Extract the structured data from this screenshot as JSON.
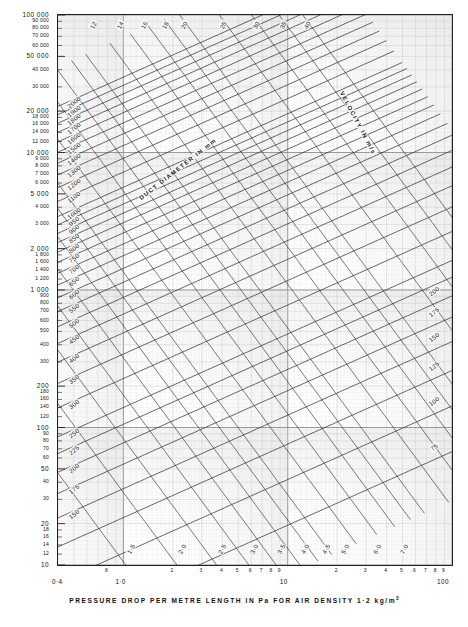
{
  "axes": {
    "ylabel": "AIR  QUANTITY  IN  LITRES  PER  SECOND",
    "xlabel_pre": "PRESSURE   DROP   PER   METRE   LENGTH   IN       Pa     FOR   AIR   DENSITY   1·2 kg/m",
    "xlabel_sup": "3"
  },
  "annotations": {
    "duct_diameter": "DUCT    DIAMETER    IN    mm",
    "velocity": "VELOCITY    IN    m/s"
  },
  "chart_data": {
    "type": "line",
    "title": "",
    "xlabel": "PRESSURE DROP PER METRE LENGTH IN Pa FOR AIR DENSITY 1·2 kg/m3",
    "ylabel": "AIR QUANTITY IN LITRES PER SECOND",
    "xscale": "log",
    "yscale": "log",
    "xlim": [
      0.4,
      100
    ],
    "ylim": [
      10,
      100000
    ],
    "grid": true,
    "legend": "none",
    "x_major_ticks": [
      "0·4",
      "1·0",
      "10",
      "100"
    ],
    "x_minor_tick_labels": [
      {
        "value": 2,
        "label": "2"
      },
      {
        "value": 3,
        "label": "3"
      },
      {
        "value": 4,
        "label": "4"
      },
      {
        "value": 5,
        "label": "5"
      },
      {
        "value": 6,
        "label": "6"
      },
      {
        "value": 7,
        "label": "7"
      },
      {
        "value": 8,
        "label": "8"
      },
      {
        "value": 9,
        "label": "9"
      },
      {
        "value": 20,
        "label": "2"
      },
      {
        "value": 30,
        "label": "3"
      },
      {
        "value": 40,
        "label": "4"
      },
      {
        "value": 50,
        "label": "5"
      },
      {
        "value": 60,
        "label": "6"
      },
      {
        "value": 70,
        "label": "7"
      },
      {
        "value": 80,
        "label": "8"
      },
      {
        "value": 90,
        "label": "9"
      },
      {
        "value": 0.8,
        "label": "8"
      }
    ],
    "y_ticks": [
      {
        "value": 100000,
        "label": "100 000",
        "major": true
      },
      {
        "value": 90000,
        "label": "90 000",
        "major": false
      },
      {
        "value": 80000,
        "label": "80 000",
        "major": false
      },
      {
        "value": 70000,
        "label": "70 000",
        "major": false
      },
      {
        "value": 60000,
        "label": "60 000",
        "major": false
      },
      {
        "value": 50000,
        "label": "50 000",
        "major": true
      },
      {
        "value": 40000,
        "label": "40 000",
        "major": false
      },
      {
        "value": 30000,
        "label": "30 000",
        "major": false
      },
      {
        "value": 20000,
        "label": "20 000",
        "major": true
      },
      {
        "value": 18000,
        "label": "18 000",
        "major": false
      },
      {
        "value": 16000,
        "label": "16 000",
        "major": false
      },
      {
        "value": 14000,
        "label": "14 000",
        "major": false
      },
      {
        "value": 12000,
        "label": "12 000",
        "major": false
      },
      {
        "value": 10000,
        "label": "10 000",
        "major": true
      },
      {
        "value": 9000,
        "label": "9 000",
        "major": false
      },
      {
        "value": 8000,
        "label": "8 000",
        "major": false
      },
      {
        "value": 7000,
        "label": "7 000",
        "major": false
      },
      {
        "value": 6000,
        "label": "6 000",
        "major": false
      },
      {
        "value": 5000,
        "label": "5 000",
        "major": true
      },
      {
        "value": 4000,
        "label": "4 000",
        "major": false
      },
      {
        "value": 3000,
        "label": "3 000",
        "major": false
      },
      {
        "value": 2000,
        "label": "2 000",
        "major": true
      },
      {
        "value": 1800,
        "label": "1 800",
        "major": false
      },
      {
        "value": 1600,
        "label": "1 600",
        "major": false
      },
      {
        "value": 1400,
        "label": "1 400",
        "major": false
      },
      {
        "value": 1200,
        "label": "1 200",
        "major": false
      },
      {
        "value": 1000,
        "label": "1 000",
        "major": true
      },
      {
        "value": 900,
        "label": "900",
        "major": false
      },
      {
        "value": 800,
        "label": "800",
        "major": false
      },
      {
        "value": 700,
        "label": "700",
        "major": false
      },
      {
        "value": 600,
        "label": "600",
        "major": false
      },
      {
        "value": 500,
        "label": "500",
        "major": false
      },
      {
        "value": 400,
        "label": "400",
        "major": false
      },
      {
        "value": 300,
        "label": "300",
        "major": false
      },
      {
        "value": 200,
        "label": "200",
        "major": true
      },
      {
        "value": 180,
        "label": "180",
        "major": false
      },
      {
        "value": 160,
        "label": "160",
        "major": false
      },
      {
        "value": 140,
        "label": "140",
        "major": false
      },
      {
        "value": 120,
        "label": "120",
        "major": false
      },
      {
        "value": 100,
        "label": "100",
        "major": true
      },
      {
        "value": 90,
        "label": "90",
        "major": false
      },
      {
        "value": 80,
        "label": "80",
        "major": false
      },
      {
        "value": 70,
        "label": "70",
        "major": false
      },
      {
        "value": 60,
        "label": "60",
        "major": false
      },
      {
        "value": 50,
        "label": "50",
        "major": true
      },
      {
        "value": 40,
        "label": "40",
        "major": false
      },
      {
        "value": 30,
        "label": "30",
        "major": false
      },
      {
        "value": 20,
        "label": "20",
        "major": true
      },
      {
        "value": 18,
        "label": "18",
        "major": false
      },
      {
        "value": 16,
        "label": "16",
        "major": false
      },
      {
        "value": 14,
        "label": "14",
        "major": false
      },
      {
        "value": 12,
        "label": "12",
        "major": false
      },
      {
        "value": 10,
        "label": "10",
        "major": true
      }
    ],
    "duct_diameter_lines_mm": [
      2000,
      1900,
      1800,
      1700,
      1600,
      1500,
      1400,
      1300,
      1200,
      1100,
      1000,
      950,
      900,
      850,
      800,
      750,
      700,
      650,
      600,
      550,
      500,
      450,
      400,
      350,
      300,
      250,
      225,
      200,
      175,
      150,
      125,
      100,
      75
    ],
    "duct_labels_left": [
      "2000",
      "1900",
      "1800",
      "1700",
      "1600",
      "1500",
      "1400",
      "1300",
      "1200",
      "1100",
      "1000",
      "950",
      "900",
      "850",
      "800",
      "750",
      "700",
      "650",
      "600",
      "550",
      "500",
      "450",
      "400",
      "350",
      "300",
      "250",
      "225",
      "200",
      "175",
      "150"
    ],
    "duct_labels_right": [
      "200",
      "175",
      "150",
      "125",
      "100",
      "75"
    ],
    "velocity_lines_ms": [
      1.0,
      1.5,
      2.0,
      2.5,
      3.0,
      3.5,
      4.0,
      4.5,
      5.0,
      6.0,
      7.0,
      8,
      9,
      10,
      12,
      14,
      16,
      18,
      20,
      25,
      30,
      35,
      40
    ],
    "velocity_labels_bottom": [
      "1·0",
      "1·5",
      "2·0",
      "2·5",
      "3·0",
      "3·5",
      "4·0",
      "4·5",
      "5·0",
      "6·0",
      "7·0"
    ],
    "velocity_labels_top": [
      "8",
      "9",
      "10",
      "12",
      "14",
      "16",
      "18",
      "20",
      "25",
      "30",
      "35",
      "40"
    ]
  },
  "colors": {
    "ink": "#1a1a1a",
    "grid_minor": "#b9b9b9",
    "grid_major": "#6e6e6e",
    "curve": "#2a2a2a"
  }
}
